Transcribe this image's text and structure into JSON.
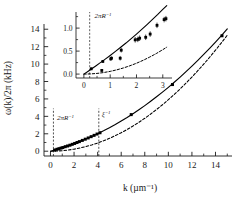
{
  "chart_data": {
    "type": "line",
    "title": "",
    "xlabel": "k (µm⁻¹)",
    "ylabel": "ω(k)/2π (kHz)",
    "xlim": [
      -0.55,
      15.4
    ],
    "ylim": [
      -0.55,
      14.6
    ],
    "xticks": [
      0,
      2,
      4,
      6,
      8,
      10,
      12,
      14
    ],
    "yticks": [
      0,
      2,
      4,
      6,
      8,
      10,
      12,
      14
    ],
    "xticklabels": [
      "0",
      "2",
      "4",
      "6",
      "8",
      "10",
      "12",
      "14"
    ],
    "yticklabels": [
      "0",
      "2",
      "4",
      "6",
      "8",
      "10",
      "12",
      "14"
    ],
    "minor_ticks": true,
    "grid": false,
    "legend": "none",
    "series": [
      {
        "name": "Bogoliubov dispersion (solid fit)",
        "style": "solid",
        "color": "#000000",
        "x": [
          0.0,
          0.2,
          0.4,
          0.6,
          0.8,
          1.0,
          1.2,
          1.5,
          1.8,
          2.1,
          2.5,
          3.0,
          3.5,
          4.0,
          4.5,
          5.0,
          5.5,
          6.0,
          6.5,
          7.0,
          7.5,
          8.0,
          8.5,
          9.0,
          9.5,
          10.0,
          10.5,
          11.0,
          11.5,
          12.0,
          12.5,
          13.0,
          13.5,
          14.0,
          14.5,
          15.0
        ],
        "y": [
          0.0,
          0.077,
          0.156,
          0.237,
          0.32,
          0.405,
          0.493,
          0.629,
          0.772,
          0.921,
          1.131,
          1.406,
          1.7,
          2.012,
          2.345,
          2.697,
          3.069,
          3.461,
          3.873,
          4.306,
          4.759,
          5.233,
          5.727,
          6.242,
          6.777,
          7.333,
          7.91,
          8.508,
          9.126,
          9.765,
          10.425,
          11.106,
          11.807,
          12.53,
          13.273,
          14.037
        ]
      },
      {
        "name": "Free-particle / quadratic dispersion (dashed)",
        "style": "dashed",
        "color": "#000000",
        "x": [
          0.0,
          0.5,
          1.0,
          1.5,
          2.0,
          2.5,
          3.0,
          3.5,
          4.0,
          4.5,
          5.0,
          5.5,
          6.0,
          6.5,
          7.0,
          7.5,
          8.0,
          8.5,
          9.0,
          9.5,
          10.0,
          10.5,
          11.0,
          11.5,
          12.0,
          12.5,
          13.0,
          13.5,
          14.0,
          14.5,
          15.0
        ],
        "y": [
          0.0,
          0.0148,
          0.059,
          0.1328,
          0.236,
          0.369,
          0.531,
          0.723,
          0.944,
          1.195,
          1.475,
          1.785,
          2.124,
          2.494,
          2.892,
          3.321,
          3.779,
          4.267,
          4.785,
          5.332,
          5.909,
          6.516,
          7.152,
          7.818,
          8.514,
          9.239,
          9.995,
          10.78,
          11.594,
          12.438,
          13.312
        ]
      }
    ],
    "data_points": {
      "name": "measured points",
      "marker": "square",
      "color": "#000000",
      "x": [
        0.35,
        0.55,
        0.72,
        0.9,
        1.05,
        1.25,
        1.45,
        1.65,
        1.85,
        2.05,
        2.25,
        2.45,
        2.7,
        2.95,
        3.2,
        3.45,
        3.7,
        3.95,
        4.2,
        6.85,
        10.35,
        14.55
      ],
      "y": [
        0.14,
        0.22,
        0.29,
        0.36,
        0.42,
        0.52,
        0.6,
        0.69,
        0.79,
        0.89,
        1.0,
        1.1,
        1.24,
        1.38,
        1.52,
        1.67,
        1.82,
        1.97,
        2.12,
        4.2,
        7.65,
        13.25
      ]
    },
    "annotations": [
      {
        "text": "2πR⁻¹",
        "x": 0.25,
        "type": "vline-dashed",
        "label_x": 0.55,
        "label_y": 3.6
      },
      {
        "text": "ξ⁻¹",
        "x": 4.1,
        "type": "vline-dashed",
        "label_x": 4.35,
        "label_y": 4.0
      }
    ],
    "inset": {
      "type": "line",
      "xlim": [
        -0.3,
        3.35
      ],
      "ylim": [
        -0.085,
        1.35
      ],
      "xticks": [
        0,
        1,
        2,
        3
      ],
      "yticks": [
        0.0,
        0.5,
        1.0
      ],
      "xticklabels": [
        "0",
        "1",
        "2",
        "3"
      ],
      "yticklabels": [
        "0.0",
        "0.5",
        "1.0"
      ],
      "minor_ticks": true,
      "series": [
        {
          "name": "Bogoliubov dispersion (solid fit)",
          "style": "solid",
          "color": "#000000",
          "x": [
            0.0,
            0.15,
            0.3,
            0.45,
            0.6,
            0.8,
            1.0,
            1.2,
            1.4,
            1.6,
            1.8,
            2.0,
            2.2,
            2.4,
            2.6,
            2.8,
            3.0,
            3.15
          ],
          "y": [
            0.0,
            0.058,
            0.117,
            0.177,
            0.238,
            0.32,
            0.405,
            0.493,
            0.583,
            0.675,
            0.772,
            0.87,
            0.972,
            1.076,
            1.183,
            1.292,
            1.406,
            1.489
          ]
        },
        {
          "name": "Free-particle / quadratic dispersion (dashed)",
          "style": "dashed",
          "color": "#000000",
          "x": [
            0.0,
            0.25,
            0.5,
            0.75,
            1.0,
            1.25,
            1.5,
            1.75,
            2.0,
            2.25,
            2.5,
            2.75,
            3.0,
            3.15
          ],
          "y": [
            0.0,
            0.0037,
            0.0148,
            0.0332,
            0.059,
            0.0922,
            0.1328,
            0.1808,
            0.236,
            0.299,
            0.369,
            0.446,
            0.531,
            0.585
          ]
        }
      ],
      "data_points": {
        "marker": "square",
        "color": "#000000",
        "x": [
          0.28,
          0.68,
          0.72,
          1.02,
          1.05,
          1.38,
          1.42,
          1.95,
          2.05,
          2.12,
          2.35,
          2.52,
          2.78,
          3.05,
          3.12
        ],
        "y": [
          0.115,
          0.08,
          0.275,
          0.33,
          0.345,
          0.345,
          0.52,
          0.745,
          0.755,
          0.78,
          0.8,
          0.87,
          1.06,
          1.185,
          1.205
        ],
        "yerr": [
          0.03,
          0.03,
          0.03,
          0.04,
          0.04,
          0.05,
          0.05,
          0.06,
          0.06,
          0.06,
          0.06,
          0.06,
          0.06,
          0.06,
          0.06
        ]
      },
      "annotations": [
        {
          "text": "2πR⁻¹",
          "x": 0.22,
          "type": "vline-dashed",
          "label_x": 0.4,
          "label_y": 1.22
        }
      ]
    }
  }
}
